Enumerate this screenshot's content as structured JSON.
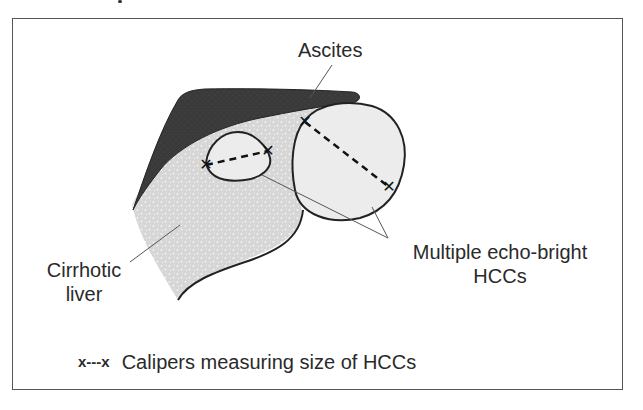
{
  "diagram": {
    "labels": {
      "ascites": "Ascites",
      "cirrhotic_liver_line1": "Cirrhotic",
      "cirrhotic_liver_line2": "liver",
      "hccs_line1": "Multiple echo-bright",
      "hccs_line2": "HCCs"
    },
    "legend": {
      "symbol": "x---x",
      "text": "Calipers measuring size of HCCs"
    },
    "colors": {
      "ascites_fill": "#3a3a3a",
      "liver_fill": "#d9d9d9",
      "hcc_fill": "#ececec",
      "outline": "#222222",
      "frame": "#555555"
    }
  }
}
